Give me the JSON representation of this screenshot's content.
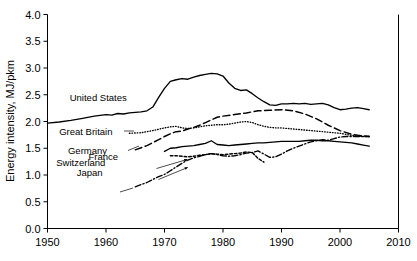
{
  "chart_data": {
    "type": "line",
    "title": "",
    "xlabel": "",
    "ylabel": "Energy intensity, MJ/pkm",
    "xlim": [
      1950,
      2010
    ],
    "ylim": [
      0.0,
      4.0
    ],
    "grid": false,
    "legend_position": "inline-labels",
    "xticks": [
      "1950",
      "1960",
      "1970",
      "1980",
      "1990",
      "2000",
      "2010"
    ],
    "xtick_values": [
      1950,
      1960,
      1970,
      1980,
      1990,
      2000,
      2010
    ],
    "yticks": [
      "0.0",
      "0.5",
      "1.0",
      "1.5",
      "2.0",
      "2.5",
      "3.0",
      "3.5",
      "4.0"
    ],
    "ytick_values": [
      0.0,
      0.5,
      1.0,
      1.5,
      2.0,
      2.5,
      3.0,
      3.5,
      4.0
    ],
    "series": [
      {
        "name": "United States",
        "style": "solid",
        "label": "United States",
        "x": [
          1950,
          1952,
          1954,
          1956,
          1958,
          1960,
          1961,
          1962,
          1963,
          1964,
          1965,
          1966,
          1967,
          1968,
          1969,
          1970,
          1971,
          1972,
          1973,
          1974,
          1975,
          1976,
          1977,
          1978,
          1979,
          1980,
          1981,
          1982,
          1983,
          1984,
          1985,
          1986,
          1987,
          1988,
          1989,
          1990,
          1991,
          1992,
          1993,
          1994,
          1995,
          1996,
          1997,
          1998,
          1999,
          2000,
          2001,
          2002,
          2003,
          2004,
          2005
        ],
        "values": [
          1.97,
          1.99,
          2.02,
          2.06,
          2.1,
          2.13,
          2.12,
          2.15,
          2.14,
          2.16,
          2.17,
          2.18,
          2.2,
          2.27,
          2.45,
          2.62,
          2.75,
          2.78,
          2.8,
          2.79,
          2.83,
          2.86,
          2.88,
          2.9,
          2.89,
          2.85,
          2.72,
          2.62,
          2.58,
          2.59,
          2.52,
          2.44,
          2.37,
          2.31,
          2.3,
          2.33,
          2.33,
          2.34,
          2.33,
          2.34,
          2.32,
          2.33,
          2.34,
          2.31,
          2.26,
          2.22,
          2.23,
          2.25,
          2.26,
          2.24,
          2.22
        ]
      },
      {
        "name": "Great Britain",
        "style": "dotted",
        "label": "Great Britain",
        "x": [
          1964,
          1966,
          1968,
          1970,
          1971,
          1972,
          1973,
          1974,
          1975,
          1976,
          1977,
          1978,
          1979,
          1980,
          1981,
          1982,
          1983,
          1984,
          1985,
          1986,
          1987,
          1988,
          1989,
          1990,
          1991,
          1992,
          1993,
          1994,
          1995,
          1996,
          1997,
          1998,
          1999,
          2000,
          2001,
          2002,
          2003,
          2004,
          2005
        ],
        "values": [
          1.78,
          1.79,
          1.83,
          1.88,
          1.9,
          1.91,
          1.88,
          1.87,
          1.88,
          1.9,
          1.92,
          1.93,
          1.94,
          1.94,
          1.95,
          1.97,
          1.99,
          2.0,
          1.98,
          1.94,
          1.91,
          1.89,
          1.88,
          1.88,
          1.87,
          1.86,
          1.85,
          1.84,
          1.83,
          1.82,
          1.81,
          1.8,
          1.79,
          1.78,
          1.76,
          1.74,
          1.73,
          1.72,
          1.72
        ]
      },
      {
        "name": "Germany",
        "style": "dashed",
        "label": "Germany",
        "x": [
          1965,
          1967,
          1969,
          1970,
          1971,
          1972,
          1973,
          1974,
          1975,
          1976,
          1977,
          1978,
          1979,
          1980,
          1982,
          1984,
          1986,
          1988,
          1990,
          1992,
          1994,
          1996,
          1998,
          2000,
          2002,
          2004,
          2005
        ],
        "values": [
          1.47,
          1.55,
          1.66,
          1.72,
          1.77,
          1.81,
          1.82,
          1.86,
          1.89,
          1.93,
          1.98,
          2.03,
          2.08,
          2.1,
          2.13,
          2.16,
          2.2,
          2.21,
          2.22,
          2.2,
          2.14,
          2.05,
          1.93,
          1.83,
          1.76,
          1.73,
          1.72
        ]
      },
      {
        "name": "France",
        "style": "solid",
        "label": "France",
        "x": [
          1970,
          1971,
          1972,
          1973,
          1974,
          1975,
          1976,
          1977,
          1978,
          1979,
          1980,
          1981,
          1982,
          1983,
          1984,
          1985,
          1986,
          1987,
          1988,
          1989,
          1990,
          1991,
          1992,
          1993,
          1994,
          1995,
          1996,
          1997,
          1998,
          1999,
          2000,
          2001,
          2002,
          2003,
          2004,
          2005
        ],
        "values": [
          1.44,
          1.5,
          1.51,
          1.53,
          1.54,
          1.55,
          1.57,
          1.59,
          1.64,
          1.57,
          1.56,
          1.55,
          1.56,
          1.57,
          1.58,
          1.59,
          1.6,
          1.6,
          1.61,
          1.62,
          1.63,
          1.63,
          1.63,
          1.63,
          1.64,
          1.65,
          1.65,
          1.64,
          1.64,
          1.63,
          1.62,
          1.61,
          1.6,
          1.58,
          1.56,
          1.54
        ]
      },
      {
        "name": "Switzerland",
        "style": "shortdash",
        "label": "Switzerland",
        "x": [
          1971,
          1972,
          1973,
          1974,
          1975,
          1976,
          1977,
          1978,
          1979,
          1980,
          1981,
          1982,
          1983,
          1984,
          1985,
          1986,
          1987
        ],
        "values": [
          1.36,
          1.36,
          1.35,
          1.34,
          1.35,
          1.37,
          1.38,
          1.4,
          1.39,
          1.38,
          1.39,
          1.4,
          1.41,
          1.43,
          1.42,
          1.31,
          1.24
        ]
      },
      {
        "name": "Japan",
        "style": "dashdot",
        "label": "Japan",
        "x": [
          1965,
          1967,
          1969,
          1970,
          1971,
          1972,
          1973,
          1974,
          1975,
          1976,
          1977,
          1978,
          1979,
          1980,
          1981,
          1982,
          1983,
          1984,
          1985,
          1986,
          1987,
          1988,
          1989,
          1990,
          1991,
          1992,
          1993,
          1994,
          1995,
          1996,
          1997,
          1998,
          1999,
          2000,
          2001,
          2002,
          2003,
          2004,
          2005
        ],
        "values": [
          0.78,
          0.86,
          0.97,
          1.01,
          1.08,
          1.15,
          1.22,
          1.28,
          1.32,
          1.35,
          1.38,
          1.4,
          1.38,
          1.36,
          1.35,
          1.36,
          1.38,
          1.41,
          1.42,
          1.45,
          1.39,
          1.33,
          1.34,
          1.39,
          1.45,
          1.5,
          1.54,
          1.58,
          1.62,
          1.64,
          1.66,
          1.65,
          1.68,
          1.71,
          1.72,
          1.72,
          1.72,
          1.72,
          1.72
        ]
      }
    ],
    "annotations": [
      {
        "text": "United States",
        "x": 1953.8,
        "y": 2.45
      },
      {
        "text": "Great Britain",
        "x": 1952.0,
        "y": 1.82
      },
      {
        "text": "Germany",
        "x": 1953.5,
        "y": 1.46
      },
      {
        "text": "France",
        "x": 1957.0,
        "y": 1.345
      },
      {
        "text": "Switzerland",
        "x": 1951.5,
        "y": 1.235
      },
      {
        "text": "Japan",
        "x": 1955.0,
        "y": 1.04
      }
    ]
  },
  "colors": {
    "line": "#000000",
    "axis": "#000000",
    "background": "#ffffff"
  }
}
